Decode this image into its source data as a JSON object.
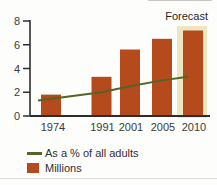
{
  "colors": {
    "bar": "#b54a1d",
    "line": "#556428",
    "band": "#ece7c2",
    "axis": "#2d2d2d",
    "tick_text": "#3a3a3a"
  },
  "chart_data": {
    "type": "bar",
    "categories": [
      "1974",
      "1991",
      "2001",
      "2005",
      "2010"
    ],
    "series": [
      {
        "name": "Millions",
        "type": "bar",
        "color": "#b54a1d",
        "values": [
          1.8,
          3.3,
          5.6,
          6.5,
          7.2
        ]
      },
      {
        "name": "As a % of all adults",
        "type": "line",
        "color": "#556428",
        "values": [
          1.3,
          2.0,
          2.5,
          3.0,
          3.3
        ]
      }
    ],
    "title": "",
    "xlabel": "",
    "ylabel": "",
    "ylim": [
      0,
      8
    ],
    "yticks": [
      0,
      2,
      4,
      6,
      8
    ],
    "grid": false,
    "legend_position": "bottom-left",
    "annotations": {
      "forecast_label": "Forecast",
      "forecast_category": "2010",
      "band_color": "#ece7c2"
    }
  }
}
